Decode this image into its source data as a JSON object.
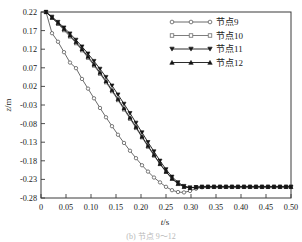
{
  "chart_data": {
    "type": "line",
    "title": "",
    "xlabel": "t/s",
    "ylabel": "z/m",
    "xlim": [
      0,
      0.5
    ],
    "ylim": [
      -0.28,
      0.22
    ],
    "grid": false,
    "legend_position": "top-right",
    "xticks": [
      "0",
      "0.05",
      "0.10",
      "0.15",
      "0.20",
      "0.25",
      "0.30",
      "0.35",
      "0.40",
      "0.45",
      "0.50"
    ],
    "xtick_values": [
      0,
      0.05,
      0.1,
      0.15,
      0.2,
      0.25,
      0.3,
      0.35,
      0.4,
      0.45,
      0.5
    ],
    "yticks": [
      "0.22",
      "0.17",
      "0.12",
      "0.07",
      "0.02",
      "-0.03",
      "-0.08",
      "-0.13",
      "-0.18",
      "-0.23",
      "-0.28"
    ],
    "ytick_values": [
      0.22,
      0.17,
      0.12,
      0.07,
      0.02,
      -0.03,
      -0.08,
      -0.13,
      -0.18,
      -0.23,
      -0.28
    ],
    "series": [
      {
        "name": "节点9",
        "marker": "circle",
        "color": "#5a5a5a",
        "x": [
          0.01,
          0.022,
          0.034,
          0.046,
          0.058,
          0.07,
          0.082,
          0.094,
          0.106,
          0.118,
          0.13,
          0.142,
          0.154,
          0.166,
          0.178,
          0.19,
          0.202,
          0.214,
          0.226,
          0.238,
          0.25,
          0.262,
          0.274,
          0.286,
          0.298,
          0.31,
          0.322,
          0.334,
          0.346,
          0.358,
          0.37,
          0.382,
          0.394,
          0.406,
          0.418,
          0.43,
          0.442,
          0.454,
          0.466,
          0.478,
          0.49,
          0.5
        ],
        "y": [
          0.22,
          0.163,
          0.14,
          0.112,
          0.084,
          0.069,
          0.04,
          0.014,
          -0.012,
          -0.038,
          -0.063,
          -0.087,
          -0.11,
          -0.132,
          -0.153,
          -0.173,
          -0.192,
          -0.209,
          -0.225,
          -0.238,
          -0.25,
          -0.259,
          -0.264,
          -0.265,
          -0.261,
          -0.255,
          -0.251,
          -0.25,
          -0.25,
          -0.25,
          -0.25,
          -0.25,
          -0.25,
          -0.25,
          -0.25,
          -0.25,
          -0.25,
          -0.25,
          -0.25,
          -0.25,
          -0.25,
          -0.25
        ]
      },
      {
        "name": "节点10",
        "marker": "square",
        "color": "#6e6e6e",
        "x": [
          0.01,
          0.022,
          0.034,
          0.046,
          0.058,
          0.07,
          0.082,
          0.094,
          0.106,
          0.118,
          0.13,
          0.142,
          0.154,
          0.166,
          0.178,
          0.19,
          0.202,
          0.214,
          0.226,
          0.238,
          0.25,
          0.262,
          0.274,
          0.286,
          0.298,
          0.31,
          0.322,
          0.334,
          0.346,
          0.358,
          0.37,
          0.382,
          0.394,
          0.406,
          0.418,
          0.43,
          0.442,
          0.454,
          0.466,
          0.478,
          0.49,
          0.5
        ],
        "y": [
          0.22,
          0.204,
          0.188,
          0.171,
          0.154,
          0.136,
          0.117,
          0.097,
          0.076,
          0.054,
          0.031,
          0.007,
          -0.017,
          -0.042,
          -0.067,
          -0.092,
          -0.117,
          -0.142,
          -0.166,
          -0.189,
          -0.21,
          -0.228,
          -0.241,
          -0.249,
          -0.252,
          -0.251,
          -0.25,
          -0.25,
          -0.25,
          -0.25,
          -0.25,
          -0.25,
          -0.25,
          -0.25,
          -0.25,
          -0.25,
          -0.25,
          -0.25,
          -0.25,
          -0.25,
          -0.25,
          -0.25
        ]
      },
      {
        "name": "节点11",
        "marker": "triangle-down",
        "color": "#141414",
        "x": [
          0.01,
          0.022,
          0.034,
          0.046,
          0.058,
          0.07,
          0.082,
          0.094,
          0.106,
          0.118,
          0.13,
          0.142,
          0.154,
          0.166,
          0.178,
          0.19,
          0.202,
          0.214,
          0.226,
          0.238,
          0.25,
          0.262,
          0.274,
          0.286,
          0.298,
          0.31,
          0.322,
          0.334,
          0.346,
          0.358,
          0.37,
          0.382,
          0.394,
          0.406,
          0.418,
          0.43,
          0.442,
          0.454,
          0.466,
          0.478,
          0.49,
          0.5
        ],
        "y": [
          0.22,
          0.207,
          0.193,
          0.178,
          0.162,
          0.145,
          0.127,
          0.108,
          0.088,
          0.067,
          0.045,
          0.022,
          -0.002,
          -0.027,
          -0.052,
          -0.078,
          -0.104,
          -0.13,
          -0.155,
          -0.18,
          -0.203,
          -0.223,
          -0.238,
          -0.248,
          -0.252,
          -0.251,
          -0.25,
          -0.25,
          -0.25,
          -0.25,
          -0.25,
          -0.25,
          -0.25,
          -0.25,
          -0.25,
          -0.25,
          -0.25,
          -0.25,
          -0.25,
          -0.25,
          -0.25,
          -0.25
        ]
      },
      {
        "name": "节点12",
        "marker": "triangle-up",
        "color": "#141414",
        "x": [
          0.01,
          0.022,
          0.034,
          0.046,
          0.058,
          0.07,
          0.082,
          0.094,
          0.106,
          0.118,
          0.13,
          0.142,
          0.154,
          0.166,
          0.178,
          0.19,
          0.202,
          0.214,
          0.226,
          0.238,
          0.25,
          0.262,
          0.274,
          0.286,
          0.298,
          0.31,
          0.322,
          0.334,
          0.346,
          0.358,
          0.37,
          0.382,
          0.394,
          0.406,
          0.418,
          0.43,
          0.442,
          0.454,
          0.466,
          0.478,
          0.49,
          0.5
        ],
        "y": [
          0.22,
          0.205,
          0.19,
          0.174,
          0.157,
          0.139,
          0.12,
          0.1,
          0.079,
          0.057,
          0.034,
          0.01,
          -0.014,
          -0.039,
          -0.064,
          -0.089,
          -0.115,
          -0.14,
          -0.164,
          -0.188,
          -0.209,
          -0.228,
          -0.242,
          -0.25,
          -0.253,
          -0.251,
          -0.25,
          -0.25,
          -0.25,
          -0.25,
          -0.25,
          -0.25,
          -0.25,
          -0.25,
          -0.25,
          -0.25,
          -0.25,
          -0.25,
          -0.25,
          -0.25,
          -0.25,
          -0.25
        ]
      }
    ]
  },
  "caption": "(b) 节点 9～12",
  "legend": {
    "entries": [
      "节点9",
      "节点10",
      "节点11",
      "节点12"
    ]
  }
}
